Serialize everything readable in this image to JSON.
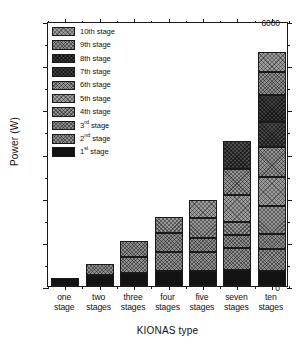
{
  "chart_data": {
    "type": "bar",
    "subtype": "stacked-bar",
    "title": "",
    "xlabel": "KIONAS type",
    "ylabel": "Power (W)",
    "ylim": [
      0,
      6000
    ],
    "ytick_values": [
      0,
      1000,
      2000,
      3000,
      4000,
      5000,
      6000
    ],
    "ytick_labels": [
      "0",
      "1000",
      "2000",
      "3000",
      "4000",
      "5000",
      "6000"
    ],
    "yminor_values": [
      500,
      1500,
      2500,
      3500,
      4500,
      5500
    ],
    "grid": false,
    "legend_position": "upper-left inside plot",
    "categories": [
      "one stage",
      "two stages",
      "three stages",
      "four stages",
      "five stages",
      "seven stages",
      "ten stages"
    ],
    "category_lines": [
      [
        "one",
        "stage"
      ],
      [
        "two",
        "stages"
      ],
      [
        "three",
        "stages"
      ],
      [
        "four",
        "stages"
      ],
      [
        "five",
        "stages"
      ],
      [
        "seven",
        "stages"
      ],
      [
        "ten",
        "stages"
      ]
    ],
    "series": [
      {
        "name": "1st stage",
        "values": [
          190,
          250,
          300,
          330,
          340,
          360,
          350
        ]
      },
      {
        "name": "2nd stage",
        "values": [
          0,
          250,
          360,
          440,
          430,
          490,
          490
        ]
      },
      {
        "name": "3rd stage",
        "values": [
          0,
          0,
          350,
          430,
          310,
          300,
          330
        ]
      },
      {
        "name": "4th stage",
        "values": [
          0,
          0,
          0,
          370,
          450,
          290,
          640
        ]
      },
      {
        "name": "5th stage",
        "values": [
          0,
          0,
          0,
          0,
          410,
          610,
          660
        ]
      },
      {
        "name": "6th stage",
        "values": [
          0,
          0,
          0,
          0,
          0,
          590,
          680
        ]
      },
      {
        "name": "7th stage",
        "values": [
          0,
          0,
          0,
          0,
          0,
          650,
          570
        ]
      },
      {
        "name": "8th stage",
        "values": [
          0,
          0,
          0,
          0,
          0,
          0,
          600
        ]
      },
      {
        "name": "9th stage",
        "values": [
          0,
          0,
          0,
          0,
          0,
          0,
          530
        ]
      },
      {
        "name": "10th stage",
        "values": [
          0,
          0,
          0,
          0,
          0,
          0,
          440
        ]
      }
    ],
    "totals": [
      190,
      500,
      1010,
      1570,
      1940,
      3290,
      5280
    ]
  },
  "legend": {
    "entries": [
      {
        "label": "10th stage",
        "ordinal": "",
        "rest": "10th stage"
      },
      {
        "label": "9th stage",
        "ordinal": "",
        "rest": "9th stage"
      },
      {
        "label": "8th stage",
        "ordinal": "",
        "rest": "8th stage"
      },
      {
        "label": "7th stage",
        "ordinal": "",
        "rest": "7th stage"
      },
      {
        "label": "6th stage",
        "ordinal": "",
        "rest": "6th stage"
      },
      {
        "label": "5th stage",
        "ordinal": "",
        "rest": "5th stage"
      },
      {
        "label": "4th stage",
        "ordinal": "",
        "rest": "4th stage"
      },
      {
        "label": "3rd stage",
        "ordinal": "rd",
        "rest": "3",
        "suffix": " stage"
      },
      {
        "label": "2nd stage",
        "ordinal": "nd",
        "rest": "2",
        "suffix": " stage"
      },
      {
        "label": "1st stage",
        "ordinal": "st",
        "rest": "1",
        "suffix": " stage"
      }
    ]
  },
  "colors": {
    "axis": "#1a1a1a",
    "background": "#ffffff",
    "stage1": "#131313",
    "hatch_light": "#9c9c9c",
    "hatch_mid": "#8f8f8f",
    "hatch_dark": "#4a4a4a"
  }
}
